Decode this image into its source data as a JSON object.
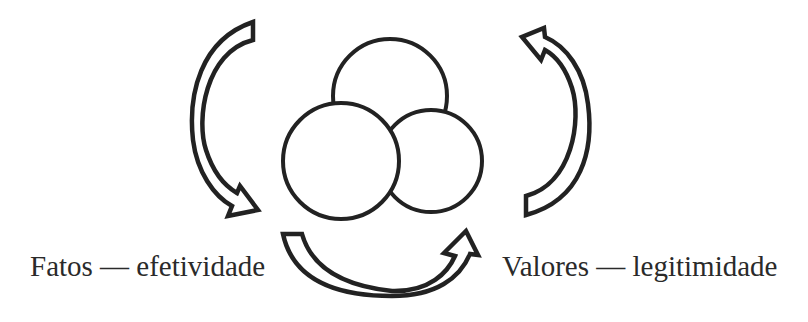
{
  "diagram": {
    "labels": {
      "left": "Fatos — efetividade",
      "right": "Valores — legitimidade"
    },
    "nodes": [
      {
        "id": "top-circle",
        "shape": "circle",
        "cx": 390,
        "cy": 96,
        "r": 57
      },
      {
        "id": "right-circle",
        "shape": "circle",
        "cx": 431,
        "cy": 161,
        "r": 51
      },
      {
        "id": "left-circle",
        "shape": "circle",
        "cx": 341,
        "cy": 161,
        "r": 58
      }
    ],
    "arrows": [
      {
        "id": "left-arrow",
        "direction": "downward-curving-left",
        "from": "top-left",
        "to": "bottom-left"
      },
      {
        "id": "bottom-arrow",
        "direction": "rightward-curving-down",
        "from": "bottom-left",
        "to": "bottom-right"
      },
      {
        "id": "right-arrow",
        "direction": "upward-curving-right",
        "from": "bottom-right",
        "to": "top-right"
      }
    ],
    "colors": {
      "stroke": "#222222",
      "fill": "#ffffff",
      "text": "#2a2a2a"
    }
  }
}
